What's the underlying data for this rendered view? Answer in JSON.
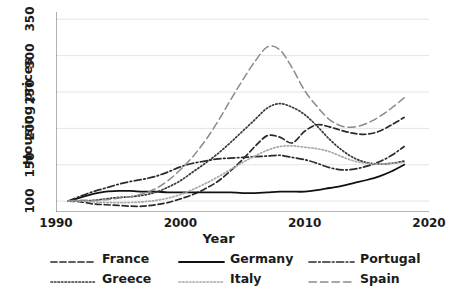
{
  "chart_data": {
    "type": "line",
    "title": "",
    "xlabel": "Year",
    "ylabel": "Housing prices",
    "xlim": [
      1990,
      2020
    ],
    "ylim": [
      85,
      360
    ],
    "xticks": [
      1990,
      2000,
      2010,
      2020
    ],
    "yticks": [
      100,
      150,
      200,
      250,
      300,
      350
    ],
    "grid": "horizontal",
    "legend_position": "bottom",
    "legend_columns": 3,
    "x": [
      1991,
      1992,
      1993,
      1994,
      1995,
      1996,
      1997,
      1998,
      1999,
      2000,
      2001,
      2002,
      2003,
      2004,
      2005,
      2006,
      2007,
      2008,
      2009,
      2010,
      2011,
      2012,
      2013,
      2014,
      2015,
      2016,
      2017,
      2018
    ],
    "series": [
      {
        "name": "France",
        "style": "dashed",
        "color": "#2a2a2a",
        "values": [
          100,
          99,
          96,
          95,
          94,
          93,
          93,
          95,
          98,
          103,
          109,
          117,
          127,
          141,
          157,
          175,
          190,
          188,
          180,
          196,
          205,
          202,
          197,
          193,
          192,
          196,
          205,
          215
        ]
      },
      {
        "name": "Germany",
        "style": "solid",
        "color": "#111111",
        "values": [
          100,
          105,
          110,
          113,
          114,
          114,
          113,
          113,
          112,
          112,
          112,
          112,
          112,
          112,
          111,
          111,
          112,
          113,
          113,
          113,
          115,
          118,
          121,
          125,
          129,
          134,
          141,
          150
        ]
      },
      {
        "name": "Portugal",
        "style": "dashdot",
        "color": "#2a2a2a",
        "values": [
          100,
          107,
          113,
          118,
          123,
          127,
          130,
          134,
          140,
          147,
          152,
          155,
          158,
          159,
          160,
          161,
          162,
          163,
          160,
          157,
          152,
          146,
          143,
          144,
          148,
          154,
          163,
          175
        ]
      },
      {
        "name": "Greece",
        "style": "dotted",
        "color": "#3a3a3a",
        "values": [
          100,
          100,
          101,
          103,
          105,
          106,
          108,
          112,
          119,
          128,
          140,
          152,
          165,
          180,
          196,
          212,
          228,
          234,
          229,
          219,
          203,
          185,
          170,
          159,
          153,
          151,
          152,
          155
        ]
      },
      {
        "name": "Italy",
        "style": "dotted-light",
        "color": "#a8a8a8",
        "values": [
          100,
          100,
          99,
          98,
          98,
          98,
          99,
          101,
          104,
          109,
          116,
          124,
          133,
          143,
          153,
          162,
          170,
          175,
          176,
          174,
          172,
          168,
          161,
          155,
          152,
          151,
          152,
          153
        ]
      },
      {
        "name": "Spain",
        "style": "longdash",
        "color": "#8a8a8a",
        "values": [
          100,
          101,
          101,
          102,
          104,
          106,
          110,
          117,
          128,
          143,
          161,
          183,
          209,
          238,
          266,
          292,
          312,
          308,
          283,
          252,
          230,
          212,
          203,
          202,
          207,
          216,
          228,
          242
        ]
      }
    ],
    "series_notes": {
      "peak_spain": {
        "year": 2007,
        "value": 352
      },
      "peak_greece": {
        "year": 2008,
        "value": 262
      },
      "peak_france": {
        "year": 2011,
        "value": 232
      },
      "peak_italy": {
        "year": 2008,
        "value": 200
      },
      "peak_portugal": {
        "year": 2008,
        "value": 168
      },
      "end_values": {
        "France": 240,
        "Germany": 165,
        "Portugal": 200,
        "Greece": 158,
        "Italy": 157,
        "Spain": 275
      }
    }
  },
  "axes": {
    "y_title": "Housing prices",
    "x_title": "Year",
    "x_tick_labels": [
      "1990",
      "2000",
      "2010",
      "2020"
    ],
    "y_tick_labels": [
      "100",
      "150",
      "200",
      "250",
      "300",
      "350"
    ]
  },
  "legend": {
    "entries": [
      {
        "label": "France",
        "key": "dashed"
      },
      {
        "label": "Germany",
        "key": "solid"
      },
      {
        "label": "Portugal",
        "key": "dashdot"
      },
      {
        "label": "Greece",
        "key": "dotted"
      },
      {
        "label": "Italy",
        "key": "dotted-light"
      },
      {
        "label": "Spain",
        "key": "longdash"
      }
    ]
  },
  "colors": {
    "axis": "#6f6f6f",
    "grid": "#e4e4e4",
    "text": "#1b1b1b",
    "background": "#ffffff"
  }
}
